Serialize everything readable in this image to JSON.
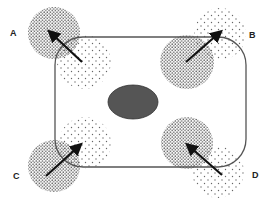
{
  "diagram": {
    "labels": [
      {
        "id": "A",
        "text": "A",
        "x": 10,
        "y": 28
      },
      {
        "id": "B",
        "text": "B",
        "x": 249,
        "y": 30
      },
      {
        "id": "C",
        "text": "C",
        "x": 13,
        "y": 171
      },
      {
        "id": "D",
        "text": "D",
        "x": 252,
        "y": 170
      }
    ],
    "cell": {
      "x": 55,
      "y": 37,
      "width": 191,
      "height": 130,
      "corner_radius": 28,
      "stroke": "#555555"
    },
    "nucleus": {
      "cx": 133,
      "cy": 102,
      "rx": 25,
      "ry": 17,
      "fill": "#555555"
    },
    "regions": [
      {
        "id": "A",
        "dense": {
          "cx": 54,
          "cy": 33,
          "r": 26
        },
        "sparse": {
          "cx": 84,
          "cy": 62,
          "r": 27
        },
        "arrow": {
          "from": [
            82,
            62
          ],
          "to": [
            48,
            30
          ]
        }
      },
      {
        "id": "B",
        "dense": {
          "cx": 187,
          "cy": 62,
          "r": 27
        },
        "sparse": {
          "cx": 220,
          "cy": 34,
          "r": 26
        },
        "arrow": {
          "from": [
            186,
            62
          ],
          "to": [
            222,
            30
          ]
        }
      },
      {
        "id": "C",
        "dense": {
          "cx": 54,
          "cy": 166,
          "r": 26
        },
        "sparse": {
          "cx": 85,
          "cy": 143,
          "r": 26
        },
        "arrow": {
          "from": [
            46,
            176
          ],
          "to": [
            82,
            143
          ]
        }
      },
      {
        "id": "D",
        "dense": {
          "cx": 187,
          "cy": 143,
          "r": 26
        },
        "sparse": {
          "cx": 218,
          "cy": 172,
          "r": 26
        },
        "arrow": {
          "from": [
            222,
            175
          ],
          "to": [
            186,
            143
          ]
        }
      }
    ],
    "colors": {
      "arrow": "#111111",
      "dots_dense": "#555555",
      "dots_sparse": "#666666"
    }
  }
}
